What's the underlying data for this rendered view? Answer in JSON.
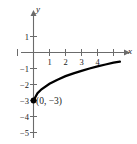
{
  "chart_data": {
    "type": "line",
    "title": "",
    "xlabel": "x",
    "ylabel": "y",
    "xlim": [
      -0.8,
      5.8
    ],
    "ylim": [
      -5.7,
      1.7
    ],
    "grid": false,
    "legend": null,
    "xticks": [
      1,
      2,
      3,
      4
    ],
    "xtick_labels": [
      "1",
      "2",
      "3",
      "4"
    ],
    "yticks": [
      1,
      -1,
      -2,
      -3,
      -4,
      -5
    ],
    "ytick_labels": [
      "1",
      "-1",
      "-2",
      "-3",
      "-4",
      "-5"
    ],
    "series": [
      {
        "name": "curve",
        "color": "#000000",
        "x": [
          0,
          0.25,
          0.5,
          1,
          1.5,
          2,
          2.5,
          3,
          3.5,
          4,
          4.5,
          5,
          5.4
        ],
        "values": [
          -3.0,
          -2.55,
          -2.3,
          -1.95,
          -1.7,
          -1.48,
          -1.3,
          -1.15,
          -1.0,
          -0.87,
          -0.75,
          -0.64,
          -0.57
        ]
      }
    ],
    "points": [
      {
        "name": "y-intercept",
        "x": 0,
        "y": -3,
        "label": "(0, −3)",
        "marker": "filled-circle",
        "color": "#000000"
      }
    ],
    "annotations": [
      {
        "text": "(0, −3)",
        "x": 0.15,
        "y": -3.45
      }
    ],
    "axis_color": "#6b6b6b",
    "curve_color": "#000000",
    "background": "#ffffff"
  },
  "figure": {
    "y_axis_label": "y",
    "x_axis_label": "x",
    "point_label": "(0, −3)"
  },
  "ticks": {
    "x": [
      {
        "label": "1"
      },
      {
        "label": "2"
      },
      {
        "label": "3"
      },
      {
        "label": "4"
      }
    ],
    "y": [
      {
        "label": "1"
      },
      {
        "label": "−1"
      },
      {
        "label": "−2"
      },
      {
        "label": "−3"
      },
      {
        "label": "−4"
      },
      {
        "label": "−5"
      }
    ]
  }
}
